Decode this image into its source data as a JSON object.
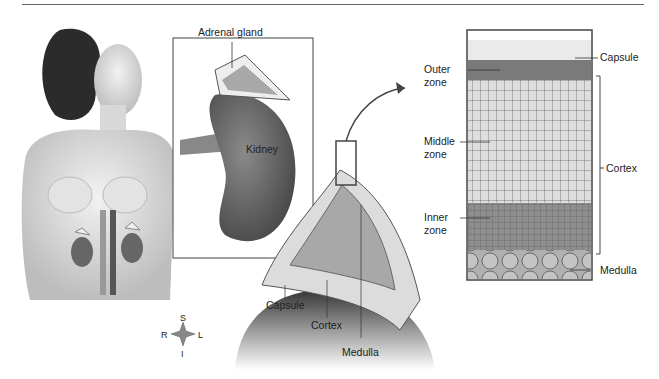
{
  "figure": {
    "panels": {
      "body": {
        "description": "female torso with kidneys and adrenal glands"
      },
      "kidney_inset": {
        "labels": {
          "adrenal_gland": "Adrenal gland",
          "kidney": "Kidney"
        }
      },
      "cross_section": {
        "labels": {
          "capsule": "Capsule",
          "cortex": "Cortex",
          "medulla": "Medulla"
        }
      },
      "histology": {
        "labels": {
          "capsule": "Capsule",
          "outer_zone": [
            "Outer",
            "zone"
          ],
          "middle_zone": [
            "Middle",
            "zone"
          ],
          "inner_zone": [
            "Inner",
            "zone"
          ],
          "cortex": "Cortex",
          "medulla": "Medulla"
        }
      }
    },
    "compass": {
      "superior": "S",
      "inferior": "I",
      "right": "R",
      "left": "L"
    },
    "colors": {
      "skin": "#e6e6e6",
      "kidney": "#6e6e6e",
      "medulla_fill": "#a8a8a8",
      "cortex_fill": "#dcdcdc",
      "outline": "#444444"
    }
  }
}
